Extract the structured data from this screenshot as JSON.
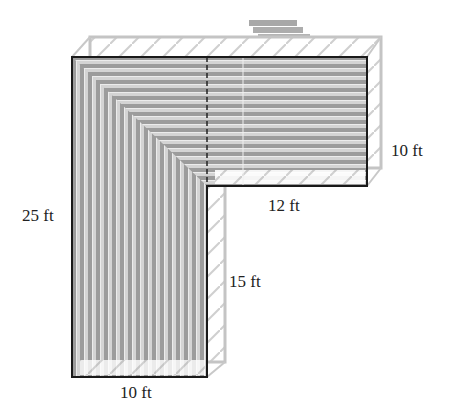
{
  "diagram": {
    "colors": {
      "outline": "#1a1a1a",
      "board_dark": "#9a9a9a",
      "board_light": "#d0d0d0",
      "frame": "#c8c8c8",
      "stairs": "#a8a8a8",
      "text": "#222222"
    },
    "labels": {
      "left_height": "25 ft",
      "top_right_height": "10 ft",
      "inner_horizontal": "12 ft",
      "inner_vertical": "15 ft",
      "bottom_width": "10 ft"
    },
    "dimensions_ft": {
      "total_height": 25,
      "top_arm_height": 10,
      "top_arm_extension": 12,
      "lower_leg_height": 15,
      "leg_width": 10
    }
  }
}
